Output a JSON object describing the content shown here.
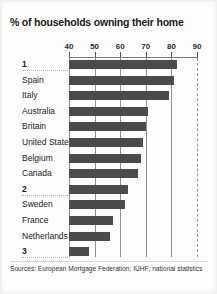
{
  "title": "% of households owning their home",
  "source": "Sources: European Mortgage Federation; IUHF; national statistics",
  "colors": {
    "bar": "#4b4b4b",
    "gridline": "#8f8f8f",
    "background": "#fdfdfd",
    "text": "#1c1c1c"
  },
  "chart_data": {
    "type": "bar",
    "orientation": "horizontal",
    "title": "% of households owning their home",
    "xlabel": "",
    "ylabel": "",
    "xlim": [
      40,
      90
    ],
    "ticks": [
      40,
      50,
      60,
      70,
      80,
      90
    ],
    "tick_labels": [
      "40",
      "50",
      "60",
      "70",
      "80",
      "90"
    ],
    "grid": true,
    "grid_axis": "x",
    "dashed_gridline_at": 90,
    "legend": "none",
    "categories": [
      "1",
      "Spain",
      "Italy",
      "Australia",
      "Britain",
      "United States",
      "Belgium",
      "Canada",
      "2",
      "Sweden",
      "France",
      "Netherlands",
      "3"
    ],
    "values": [
      82,
      81,
      79,
      71,
      70,
      69,
      68,
      67,
      63,
      62,
      57,
      56,
      48
    ],
    "redacted_categories": [
      "1",
      "2",
      "3"
    ]
  },
  "rows": [
    {
      "label": "1",
      "value": 82,
      "redacted": true
    },
    {
      "label": "Spain",
      "value": 81,
      "redacted": false
    },
    {
      "label": "Italy",
      "value": 79,
      "redacted": false
    },
    {
      "label": "Australia",
      "value": 71,
      "redacted": false
    },
    {
      "label": "Britain",
      "value": 70,
      "redacted": false
    },
    {
      "label": "United States",
      "value": 69,
      "redacted": false
    },
    {
      "label": "Belgium",
      "value": 68,
      "redacted": false
    },
    {
      "label": "Canada",
      "value": 67,
      "redacted": false
    },
    {
      "label": "2",
      "value": 63,
      "redacted": true
    },
    {
      "label": "Sweden",
      "value": 62,
      "redacted": false
    },
    {
      "label": "France",
      "value": 57,
      "redacted": false
    },
    {
      "label": "Netherlands",
      "value": 56,
      "redacted": false
    },
    {
      "label": "3",
      "value": 48,
      "redacted": true
    }
  ]
}
